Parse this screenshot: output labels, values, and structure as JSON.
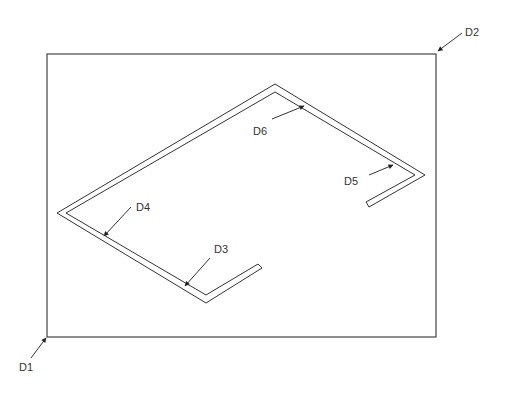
{
  "diagram": {
    "type": "isometric-technical-drawing",
    "colors": {
      "line": "#333333",
      "background": "#ffffff"
    },
    "frame": {
      "description": "rectangular view boundary",
      "top_left": [
        47,
        54
      ],
      "bottom_right": [
        436,
        337
      ]
    },
    "labels": [
      {
        "id": "D1",
        "text": "D1",
        "target": "frame-bottom-left-corner"
      },
      {
        "id": "D2",
        "text": "D2",
        "target": "frame-top-right-corner"
      },
      {
        "id": "D3",
        "text": "D3",
        "target": "channel-front-edge-near-end"
      },
      {
        "id": "D4",
        "text": "D4",
        "target": "channel-left-front-edge"
      },
      {
        "id": "D5",
        "text": "D5",
        "target": "channel-right-back-edge"
      },
      {
        "id": "D6",
        "text": "D6",
        "target": "channel-top-back-edge"
      }
    ]
  }
}
